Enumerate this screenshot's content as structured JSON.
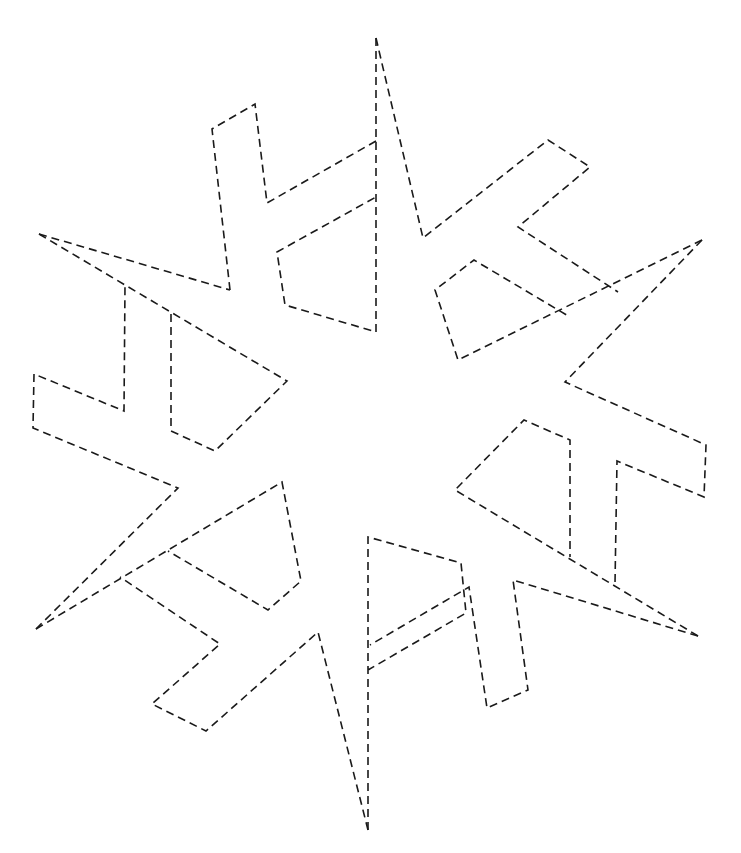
{
  "diagram": {
    "type": "dashed-outline",
    "stroke_color": "#1a1a1a",
    "background_color": "#ffffff",
    "text_labels": [],
    "segments": [
      {
        "name": "top-arm-left-spoke",
        "points": "376,38 376,332 285,305 277,252 376,197"
      },
      {
        "name": "top-arm-left-branch",
        "points": "376,141 267,203 255,104 212,129 230,290"
      },
      {
        "name": "top-arm-right-edge",
        "points": "376,38 423,238 548,140 590,167 518,227 618,292"
      },
      {
        "name": "right-upper-arm",
        "points": "702,240 458,360 435,290 474,260 570,317"
      },
      {
        "name": "right-upper-arm-outer",
        "points": "702,240 565,382 706,445 704,497 617,461 615,584"
      },
      {
        "name": "right-lower-arm",
        "points": "698,636 455,490 524,420 570,440 570,557"
      },
      {
        "name": "right-lower-arm-outer",
        "points": "698,636 513,580 528,690 487,708 469,587 370,645"
      },
      {
        "name": "bottom-arm",
        "points": "368,830 368,537 461,563 466,613 368,670"
      },
      {
        "name": "bottom-arm-outer",
        "points": "368,830 318,632 206,731 152,704 220,644 120,577"
      },
      {
        "name": "left-lower-arm",
        "points": "36,629 282,482 301,581 268,610 168,551"
      },
      {
        "name": "left-lower-arm-outer",
        "points": "36,629 178,488 33,428 34,374 124,411 125,285"
      },
      {
        "name": "left-upper-arm",
        "points": "39,234 287,381 215,451 171,431 171,313"
      },
      {
        "name": "left-upper-arm-outer",
        "points": "39,234 230,290"
      }
    ]
  }
}
